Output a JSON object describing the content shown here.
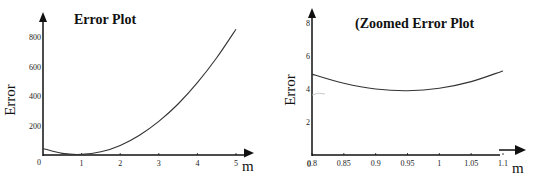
{
  "chart_data": [
    {
      "type": "line",
      "title": "Error Plot",
      "xlabel": "m",
      "ylabel": "Error",
      "xlim": [
        0,
        5
      ],
      "ylim": [
        0,
        800
      ],
      "x_ticks": [
        "0",
        "1",
        "2",
        "3",
        "4",
        "5"
      ],
      "y_ticks": [
        "200",
        "400",
        "600",
        "800"
      ],
      "grid": false,
      "series": [
        {
          "name": "Error",
          "x": [
            0,
            0.5,
            1,
            1.5,
            2,
            2.5,
            3,
            3.5,
            4,
            4.5,
            5
          ],
          "values": [
            44,
            11,
            4,
            22,
            65,
            134,
            228,
            346,
            490,
            659,
            853
          ]
        }
      ]
    },
    {
      "type": "line",
      "title": "(Zoomed Error Plot",
      "xlabel": "m",
      "ylabel": "Error",
      "xlim": [
        0.8,
        1.1
      ],
      "ylim": [
        0,
        8
      ],
      "x_ticks": [
        "0.8",
        "0.85",
        "0.9",
        "0.95",
        "1",
        "1.05",
        "1.1"
      ],
      "y_ticks": [
        "0",
        "2",
        "4",
        "6",
        "8"
      ],
      "grid": false,
      "series": [
        {
          "name": "Error",
          "x": [
            0.8,
            0.85,
            0.9,
            0.95,
            1.0,
            1.05,
            1.1
          ],
          "values": [
            4.9,
            4.35,
            4.0,
            3.9,
            4.05,
            4.45,
            5.1
          ]
        }
      ]
    }
  ]
}
